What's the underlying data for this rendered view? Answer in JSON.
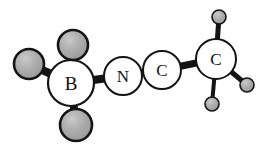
{
  "figure": {
    "name": "ball-and-stick-molecular-structure",
    "background_color": "#ffffff",
    "width": 267,
    "height": 151
  },
  "style": {
    "bond_color": "#141414",
    "labeled_atom_fill": "#ffffff",
    "labeled_atom_stroke": "#141414",
    "substituent_fill": "#a9a9a9",
    "substituent_highlight": "#c4c4c4",
    "substituent_stroke": "#141414",
    "label_color": "#111111"
  },
  "atoms": [
    {
      "id": "B1",
      "label": "B",
      "element": "B",
      "kind": "labeled",
      "x": 71,
      "y": 83,
      "r": 23,
      "stroke_width": 2.2,
      "font_size": 19
    },
    {
      "id": "N1",
      "label": "N",
      "element": "N",
      "kind": "labeled",
      "x": 123,
      "y": 76,
      "r": 19,
      "stroke_width": 2.0,
      "font_size": 17
    },
    {
      "id": "C1",
      "label": "C",
      "element": "C",
      "kind": "labeled",
      "x": 162,
      "y": 70,
      "r": 19,
      "stroke_width": 2.0,
      "font_size": 17
    },
    {
      "id": "C2",
      "label": "C",
      "element": "C",
      "kind": "labeled",
      "x": 216,
      "y": 59,
      "r": 20,
      "stroke_width": 2.0,
      "font_size": 17
    },
    {
      "id": "H1",
      "label": "",
      "element": "H",
      "kind": "substituent",
      "x": 29,
      "y": 64,
      "r": 15,
      "stroke_width": 2.6
    },
    {
      "id": "H2",
      "label": "",
      "element": "H",
      "kind": "substituent",
      "x": 73,
      "y": 45,
      "r": 15,
      "stroke_width": 2.6
    },
    {
      "id": "H3",
      "label": "",
      "element": "H",
      "kind": "substituent",
      "x": 76,
      "y": 125,
      "r": 16,
      "stroke_width": 2.6
    },
    {
      "id": "H4",
      "label": "",
      "element": "H",
      "kind": "substituent",
      "x": 219,
      "y": 17,
      "r": 7,
      "stroke_width": 1.6
    },
    {
      "id": "H5",
      "label": "",
      "element": "H",
      "kind": "substituent",
      "x": 247,
      "y": 85,
      "r": 7,
      "stroke_width": 1.6
    },
    {
      "id": "H6",
      "label": "",
      "element": "H",
      "kind": "substituent",
      "x": 212,
      "y": 104,
      "r": 7,
      "stroke_width": 1.6
    }
  ],
  "bonds": [
    {
      "id": "b-h1",
      "from": "H1",
      "to": "B1",
      "width": 8
    },
    {
      "id": "b-h2",
      "from": "H2",
      "to": "B1",
      "width": 8
    },
    {
      "id": "b-h3",
      "from": "H3",
      "to": "B1",
      "width": 8
    },
    {
      "id": "b-n",
      "from": "B1",
      "to": "N1",
      "width": 8
    },
    {
      "id": "n-c1",
      "from": "N1",
      "to": "C1",
      "width": 6
    },
    {
      "id": "c1-c2",
      "from": "C1",
      "to": "C2",
      "width": 7
    },
    {
      "id": "c2-h4",
      "from": "C2",
      "to": "H4",
      "width": 5
    },
    {
      "id": "c2-h5",
      "from": "C2",
      "to": "H5",
      "width": 5
    },
    {
      "id": "c2-h6",
      "from": "C2",
      "to": "H6",
      "width": 4
    }
  ]
}
